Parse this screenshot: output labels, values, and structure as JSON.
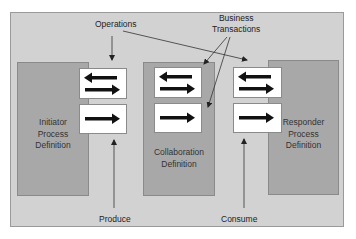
{
  "diagram": {
    "labels": {
      "operations": "Operations",
      "business_transactions_line1": "Business",
      "business_transactions_line2": "Transactions",
      "produce": "Produce",
      "consume": "Consume"
    },
    "processes": [
      {
        "id": "initiator",
        "lines": [
          "Initiator",
          "Process",
          "Definition"
        ]
      },
      {
        "id": "collaboration",
        "lines": [
          "Collaboration",
          "Definition"
        ]
      },
      {
        "id": "responder",
        "lines": [
          "Responder",
          "Process",
          "Definition"
        ]
      }
    ],
    "operation_boxes": [
      {
        "group": "initiator",
        "type": "bidirectional"
      },
      {
        "group": "initiator",
        "type": "one-way"
      },
      {
        "group": "collaboration",
        "type": "bidirectional"
      },
      {
        "group": "collaboration",
        "type": "one-way"
      },
      {
        "group": "responder",
        "type": "bidirectional"
      },
      {
        "group": "responder",
        "type": "one-way"
      }
    ],
    "colors": {
      "frame": "#d2d2d2",
      "process": "#a8a8a8",
      "operation": "#ffffff",
      "arrow": "#111111"
    }
  }
}
